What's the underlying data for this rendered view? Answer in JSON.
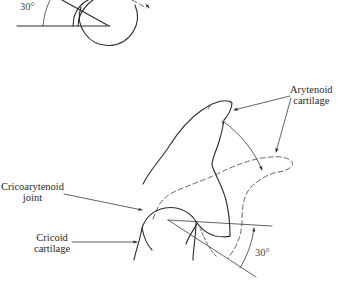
{
  "figure": {
    "top_panel": {
      "angle_label": "30°"
    },
    "bottom_panel": {
      "labels": {
        "arytenoid_line1": "Arytenoid",
        "arytenoid_line2": "cartilage",
        "cricoarytenoid_line1": "Cricoarytenoid",
        "cricoarytenoid_line2": "joint",
        "cricoid_line1": "Cricoid",
        "cricoid_line2": "cartilage",
        "angle_label": "30°"
      }
    },
    "colors": {
      "line": "#2a2a2a",
      "dashed": "#555555",
      "background": "#ffffff"
    }
  }
}
